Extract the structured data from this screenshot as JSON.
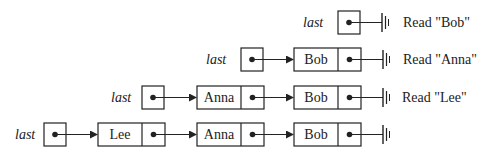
{
  "diagram": {
    "title": "",
    "pointer_label": "last",
    "rows": [
      {
        "pointer": "last",
        "nodes": [],
        "caption": "Read \"Bob\""
      },
      {
        "pointer": "last",
        "nodes": [
          "Bob"
        ],
        "caption": "Read \"Anna\""
      },
      {
        "pointer": "last",
        "nodes": [
          "Anna",
          "Bob"
        ],
        "caption": "Read \"Lee\""
      },
      {
        "pointer": "last",
        "nodes": [
          "Lee",
          "Anna",
          "Bob"
        ],
        "caption": ""
      }
    ]
  },
  "colors": {
    "stroke": "#222222",
    "background": "#ffffff"
  }
}
